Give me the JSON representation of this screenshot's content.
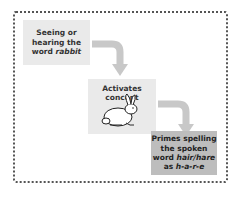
{
  "diagram": {
    "steps": [
      {
        "pre": "Seeing or hearing the word ",
        "em": "rabbit",
        "post": ""
      },
      {
        "pre": "Activates concept",
        "em": "",
        "post": ""
      },
      {
        "pre": "Primes spelling the spoken word ",
        "em": "hair/hare",
        "post": " as ",
        "em2": "h-a-r-e"
      }
    ],
    "image": "rabbit-drawing",
    "colors": {
      "box_light": "#eaeaea",
      "box_dark": "#bdbdbd",
      "arrow": "#c8c8c8",
      "border": "#555555"
    }
  }
}
